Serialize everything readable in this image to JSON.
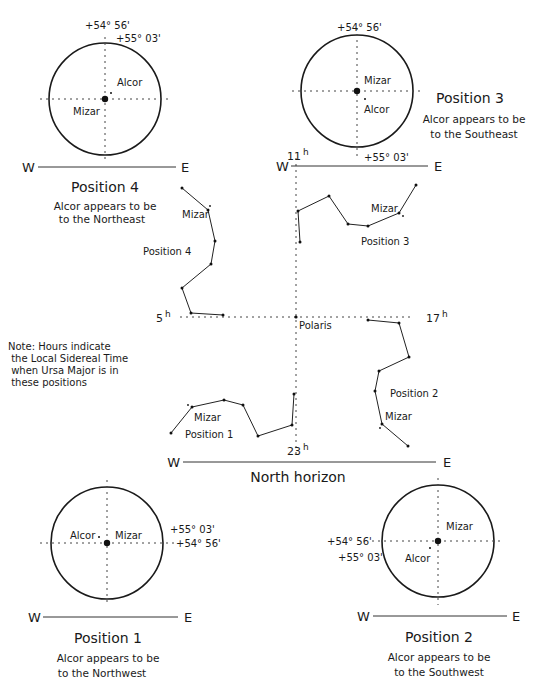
{
  "colors": {
    "ink": "#1a1a1a",
    "background": "#ffffff"
  },
  "horizon": {
    "label": "North horizon",
    "west": "W",
    "east": "E",
    "line": {
      "x1": 183,
      "x2": 436,
      "y": 462
    }
  },
  "axes": {
    "polaris": {
      "label": "Polaris",
      "x": 296,
      "y": 317
    },
    "vertical": {
      "x": 296,
      "y1": 158,
      "y2": 455
    },
    "horizontal": {
      "y": 317,
      "x1": 180,
      "x2": 412
    },
    "hours": [
      {
        "id": "11h",
        "num": "11",
        "sup": "h",
        "x": 287,
        "y": 160
      },
      {
        "id": "5h",
        "num": "5",
        "sup": "h",
        "x": 156,
        "y": 322
      },
      {
        "id": "17h",
        "num": "17",
        "sup": "h",
        "x": 426,
        "y": 322
      },
      {
        "id": "23h",
        "num": "23",
        "sup": "h",
        "x": 287,
        "y": 455
      }
    ]
  },
  "note": {
    "lines": [
      "Note: Hours indicate",
      " the Local Sidereal Time",
      " when Ursa Major is in",
      " these positions"
    ]
  },
  "constellations": [
    {
      "id": "position-1",
      "label": "Position 1",
      "label_pos": [
        185,
        438
      ],
      "mizar_label": "Mizar",
      "mizar_label_pos": [
        194,
        421
      ],
      "stars": [
        [
          171,
          433
        ],
        [
          192,
          407
        ],
        [
          224,
          400
        ],
        [
          243,
          405
        ],
        [
          258,
          436
        ],
        [
          292,
          425
        ],
        [
          294,
          394
        ]
      ],
      "alcor": [
        188,
        405
      ]
    },
    {
      "id": "position-2",
      "label": "Position 2",
      "label_pos": [
        390,
        397
      ],
      "mizar_label": "Mizar",
      "mizar_label_pos": [
        385,
        420
      ],
      "stars": [
        [
          368,
          320
        ],
        [
          399,
          323
        ],
        [
          409,
          357
        ],
        [
          379,
          371
        ],
        [
          375,
          391
        ],
        [
          382,
          424
        ],
        [
          408,
          446
        ]
      ],
      "alcor": [
        380,
        428
      ]
    },
    {
      "id": "position-3",
      "label": "Position 3",
      "label_pos": [
        361,
        245
      ],
      "mizar_label": "Mizar",
      "mizar_label_pos": [
        371,
        212
      ],
      "stars": [
        [
          300,
          242
        ],
        [
          298,
          211
        ],
        [
          329,
          196
        ],
        [
          348,
          224
        ],
        [
          368,
          226
        ],
        [
          399,
          213
        ],
        [
          416,
          185
        ]
      ],
      "alcor": [
        403,
        216
      ]
    },
    {
      "id": "position-4",
      "label": "Position 4",
      "label_pos": [
        143,
        255
      ],
      "mizar_label": "Mizar",
      "mizar_label_pos": [
        182,
        218
      ],
      "stars": [
        [
          182,
          188
        ],
        [
          208,
          210
        ],
        [
          215,
          241
        ],
        [
          211,
          264
        ],
        [
          182,
          288
        ],
        [
          191,
          313
        ],
        [
          223,
          315
        ]
      ],
      "alcor": [
        210,
        206
      ]
    }
  ],
  "views": [
    {
      "id": "view-position-4",
      "title": "Position 4",
      "desc1": "Alcor appears to be",
      "desc2": "to the Northeast",
      "circle": {
        "cx": 105,
        "cy": 99,
        "r": 56
      },
      "vline": {
        "y1": 37,
        "y2": 162
      },
      "hline": {
        "x1": 40,
        "x2": 172
      },
      "mizar_label": "Mizar",
      "mizar_label_pos": [
        73,
        115
      ],
      "alcor_label": "Alcor",
      "alcor_label_pos": [
        117,
        86
      ],
      "alcor_dot": [
        111,
        93
      ],
      "deg_a": {
        "text": "+54° 56'",
        "x": 85,
        "y": 29
      },
      "deg_b": {
        "text": "+55° 03'",
        "x": 116,
        "y": 42
      },
      "horizon": {
        "x1": 38,
        "x2": 176,
        "y": 167,
        "w_x": 22,
        "e_x": 181
      },
      "title_pos": [
        105,
        192
      ],
      "desc1_pos": [
        105,
        210
      ],
      "desc2_pos": [
        102,
        223
      ]
    },
    {
      "id": "view-position-3",
      "title": "Position 3",
      "desc1": "Alcor appears to be",
      "desc2": "to the Southeast",
      "circle": {
        "cx": 357,
        "cy": 91,
        "r": 56
      },
      "vline": {
        "y1": 28,
        "y2": 158
      },
      "hline": {
        "x1": 292,
        "x2": 422
      },
      "mizar_label": "Mizar",
      "mizar_label_pos": [
        364,
        84
      ],
      "alcor_label": "Alcor",
      "alcor_label_pos": [
        364,
        113
      ],
      "alcor_dot": [
        365,
        99
      ],
      "deg_a": {
        "text": "+54° 56'",
        "x": 337,
        "y": 31
      },
      "deg_b": {
        "text": "+55° 03'",
        "x": 364,
        "y": 161
      },
      "horizon": {
        "x1": 291,
        "x2": 428,
        "y": 166,
        "w_x": 276,
        "e_x": 434
      },
      "title_pos": [
        470,
        103
      ],
      "desc1_pos": [
        474,
        123
      ],
      "desc2_pos": [
        474,
        138
      ]
    },
    {
      "id": "view-position-1",
      "title": "Position 1",
      "desc1": "Alcor appears to be",
      "desc2": "to the Northwest",
      "circle": {
        "cx": 107,
        "cy": 543,
        "r": 56
      },
      "vline": {
        "y1": 480,
        "y2": 606
      },
      "hline": {
        "x1": 40,
        "x2": 178
      },
      "mizar_label": "Mizar",
      "mizar_label_pos": [
        115,
        539
      ],
      "alcor_label": "Alcor",
      "alcor_label_pos": [
        70,
        539
      ],
      "alcor_dot": [
        99,
        537
      ],
      "deg_a": {
        "text": "+55° 03'",
        "x": 170,
        "y": 533
      },
      "deg_b": {
        "text": "+54° 56'",
        "x": 176,
        "y": 547
      },
      "horizon": {
        "x1": 43,
        "x2": 178,
        "y": 617,
        "w_x": 28,
        "e_x": 184
      },
      "title_pos": [
        108,
        643
      ],
      "desc1_pos": [
        108,
        662
      ],
      "desc2_pos": [
        102,
        677
      ]
    },
    {
      "id": "view-position-2",
      "title": "Position 2",
      "desc1": "Alcor appears to be",
      "desc2": "to the Southwest",
      "circle": {
        "cx": 438,
        "cy": 541,
        "r": 56
      },
      "vline": {
        "y1": 478,
        "y2": 605
      },
      "hline": {
        "x1": 372,
        "x2": 502
      },
      "mizar_label": "Mizar",
      "mizar_label_pos": [
        446,
        530
      ],
      "alcor_label": "Alcor",
      "alcor_label_pos": [
        405,
        562
      ],
      "alcor_dot": [
        430,
        548
      ],
      "deg_a": {
        "text": "+54° 56'",
        "x": 327,
        "y": 545
      },
      "deg_b": {
        "text": "+55° 03'",
        "x": 338,
        "y": 561
      },
      "horizon": {
        "x1": 373,
        "x2": 507,
        "y": 616,
        "w_x": 357,
        "e_x": 512
      },
      "title_pos": [
        439,
        642
      ],
      "desc1_pos": [
        439,
        661
      ],
      "desc2_pos": [
        439,
        676
      ]
    }
  ]
}
